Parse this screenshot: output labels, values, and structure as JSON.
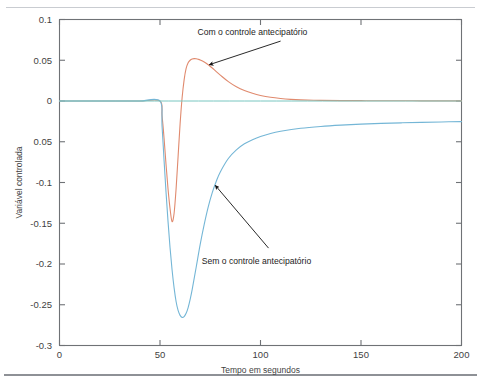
{
  "figure": {
    "background_color": "#ffffff",
    "top_rule_color": "#c9ccd1",
    "bottom_rule_color": "#8e9196",
    "axis_color": "#6f7276"
  },
  "chart_data": {
    "type": "line",
    "title": "",
    "xlabel": "Tempo em segundos",
    "ylabel": "Variável controlada",
    "xlim": [
      0,
      200
    ],
    "ylim": [
      -0.3,
      0.1
    ],
    "grid": false,
    "legend_position": "none",
    "xticks": [
      0,
      50,
      100,
      150,
      200
    ],
    "xtick_labels": [
      "0",
      "50",
      "100",
      "150",
      "200"
    ],
    "yticks": [
      0.1,
      0.05,
      0,
      -0.05,
      -0.1,
      -0.15,
      -0.2,
      -0.25,
      -0.3
    ],
    "ytick_labels": [
      "0.1",
      "0.05",
      "0",
      "0.05",
      "-0.1",
      "-0.15",
      "-0.2",
      "-0.25",
      "-0.3"
    ],
    "annotations": [
      {
        "text": "Com o controle antecipatório",
        "text_x": 96,
        "text_y": 0.0805,
        "arrow_tip_x": 74.5,
        "arrow_tip_y": 0.0445,
        "arrow_tail_x": 110,
        "arrow_tail_y": 0.0735
      },
      {
        "text": "Sem o controle antecipatório",
        "text_x": 98,
        "text_y": -0.2005,
        "arrow_tip_x": 77.5,
        "arrow_tip_y": -0.1035,
        "arrow_tail_x": 104,
        "arrow_tail_y": -0.1805
      }
    ],
    "series": [
      {
        "name": "Com o controle antecipatório",
        "color": "#e08a6e",
        "line_width": 1.1,
        "x": [
          0,
          10,
          20,
          30,
          40,
          50,
          51,
          52,
          53,
          54,
          55,
          56,
          57,
          58,
          59,
          60,
          61,
          62,
          63,
          64,
          65,
          66,
          67,
          68,
          69,
          70,
          72,
          74,
          76,
          78,
          80,
          84,
          88,
          92,
          96,
          100,
          105,
          110,
          115,
          120,
          130,
          140,
          150,
          160,
          170,
          180,
          190,
          200
        ],
        "y": [
          0,
          0,
          0,
          0,
          0,
          0,
          -0.018,
          -0.045,
          -0.078,
          -0.108,
          -0.132,
          -0.148,
          -0.138,
          -0.108,
          -0.068,
          -0.028,
          0.004,
          0.026,
          0.04,
          0.047,
          0.05,
          0.0515,
          0.052,
          0.0518,
          0.0512,
          0.0503,
          0.0478,
          0.0445,
          0.0405,
          0.036,
          0.0318,
          0.0238,
          0.0175,
          0.0128,
          0.0094,
          0.0068,
          0.0045,
          0.003,
          0.002,
          0.0014,
          0.0008,
          0.0005,
          0.0004,
          0.0003,
          0.0003,
          0.0002,
          0.0002,
          0.0002
        ]
      },
      {
        "name": "Sem o controle antecipatório",
        "color": "#74b6d6",
        "line_width": 1.1,
        "x": [
          0,
          10,
          20,
          30,
          40,
          50,
          51,
          52,
          53,
          54,
          55,
          56,
          57,
          58,
          59,
          60,
          61,
          62,
          63,
          64,
          65,
          66,
          68,
          70,
          72,
          74,
          76,
          78,
          80,
          84,
          88,
          92,
          96,
          100,
          105,
          110,
          120,
          130,
          140,
          150,
          160,
          170,
          180,
          190,
          200
        ],
        "y": [
          0,
          0,
          0,
          0,
          0,
          0,
          -0.03,
          -0.072,
          -0.112,
          -0.148,
          -0.18,
          -0.207,
          -0.229,
          -0.246,
          -0.257,
          -0.263,
          -0.2655,
          -0.2645,
          -0.2605,
          -0.2535,
          -0.2435,
          -0.2315,
          -0.204,
          -0.176,
          -0.1515,
          -0.13,
          -0.1125,
          -0.0985,
          -0.087,
          -0.0705,
          -0.06,
          -0.0525,
          -0.0475,
          -0.0435,
          -0.0398,
          -0.0372,
          -0.0335,
          -0.0312,
          -0.0296,
          -0.0284,
          -0.0275,
          -0.0268,
          -0.0262,
          -0.0257,
          -0.0253
        ]
      },
      {
        "name": "Referência (zero)",
        "color": "#79c6c0",
        "line_width": 1.0,
        "x": [
          0,
          200
        ],
        "y": [
          0,
          0
        ]
      }
    ]
  }
}
